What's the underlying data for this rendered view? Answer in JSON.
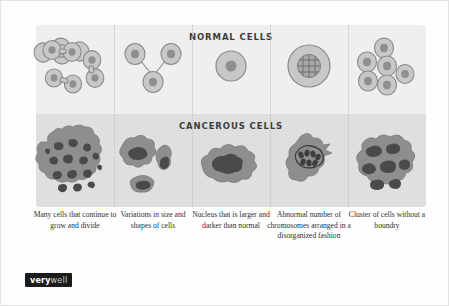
{
  "figure": {
    "title_normal": "NORMAL CELLS",
    "title_cancerous": "CANCEROUS CELLS",
    "colors": {
      "band_normal_bg": "#efefef",
      "band_cancer_bg": "#dfdfdf",
      "cell_membrane_fill": "#c8c8c8",
      "cell_membrane_stroke": "#8a8a8a",
      "nucleus_fill": "#8f8f8f",
      "cancer_cell_fill": "#8e8e8e",
      "cancer_nucleus_fill": "#4a4a4a",
      "page_bg": "#ffffff",
      "text": "#2f2f2f",
      "logo_bg": "#1c1c1c"
    }
  },
  "columns": [
    {
      "id": "col-1",
      "caption": "Many cells that continue to grow and divide",
      "normal_label": "dividing-normal-cells",
      "cancer_label": "large-mass-of-cancer-cells"
    },
    {
      "id": "col-2",
      "caption": "Variations in size and shapes of cells",
      "normal_label": "three-uniform-normal-cells",
      "cancer_label": "irregular-varied-cancer-cells"
    },
    {
      "id": "col-3",
      "caption": "Nucleus that is larger and darker than normal",
      "normal_label": "single-normal-cell-small-nucleus",
      "cancer_label": "cancer-cell-large-dark-nucleus"
    },
    {
      "id": "col-4",
      "caption": "Abnormal number of chromosomes arranged in a disorganized fashion",
      "normal_label": "normal-cell-organized-chromosomes",
      "cancer_label": "cancer-cell-disorganized-chromosomes"
    },
    {
      "id": "col-5",
      "caption": "Cluster of cells without a boundry",
      "normal_label": "cluster-of-normal-cells-with-boundary",
      "cancer_label": "cluster-of-cancer-cells-no-boundary"
    }
  ],
  "logo": {
    "part1": "very",
    "part2": "well"
  }
}
